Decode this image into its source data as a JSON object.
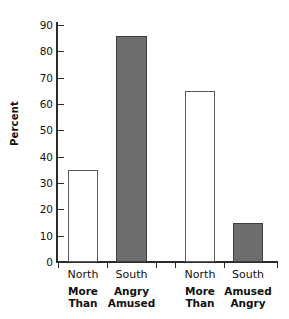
{
  "chart_data": {
    "type": "bar",
    "title": "",
    "xlabel": "",
    "ylabel": "Percent",
    "ylim": [
      0,
      90
    ],
    "ytick_step": 10,
    "grid": false,
    "legend": "none",
    "yticks": [
      90,
      80,
      70,
      60,
      50,
      40,
      30,
      20,
      10,
      0
    ],
    "categories": [
      "North",
      "South",
      "North",
      "South"
    ],
    "values": [
      35,
      86,
      65,
      15
    ],
    "bar_styles": [
      "open",
      "filled",
      "open",
      "filled"
    ],
    "groups": [
      {
        "name": "More Than Angry Amused",
        "lines": [
          "More Angry",
          "Than Amused"
        ],
        "columns": [
          {
            "category": "North",
            "line1": "More",
            "line2": "Than",
            "value": 35,
            "style": "open"
          },
          {
            "category": "South",
            "line1": "Angry",
            "line2": "Amused",
            "value": 86,
            "style": "filled"
          }
        ]
      },
      {
        "name": "More Amused Than Angry",
        "lines": [
          "More Amused",
          "Than Angry"
        ],
        "columns": [
          {
            "category": "North",
            "line1": "More",
            "line2": "Than",
            "value": 65,
            "style": "open"
          },
          {
            "category": "South",
            "line1": "Amused",
            "line2": "Angry",
            "value": 15,
            "style": "filled"
          }
        ]
      }
    ],
    "colors": {
      "open_fill": "#ffffff",
      "open_stroke": "#5a5a5a",
      "filled_fill": "#6e6e6e",
      "filled_stroke": "#3d3d3d",
      "axis": "#2b2b2b",
      "text": "#111111",
      "background": "#ffffff"
    }
  }
}
